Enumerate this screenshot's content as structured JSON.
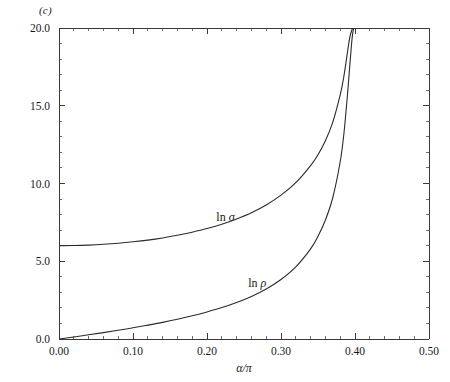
{
  "figure": {
    "panel_label": "(c)",
    "background_color": "#ffffff",
    "line_color": "#2b2b2b",
    "axis_color": "#3a3a3a"
  },
  "axes": {
    "x": {
      "label": "α/π",
      "min": 0.0,
      "max": 0.5,
      "major_ticks": [
        0.0,
        0.1,
        0.2,
        0.3,
        0.4,
        0.5
      ],
      "major_tick_labels": [
        "0.00",
        "0.10",
        "0.20",
        "0.30",
        "0.40",
        "0.50"
      ],
      "minor_tick_step": 0.02
    },
    "y": {
      "label": "",
      "min": 0.0,
      "max": 20.0,
      "major_ticks": [
        0.0,
        5.0,
        10.0,
        15.0,
        20.0
      ],
      "major_tick_labels": [
        "0.0",
        "5.0",
        "10.0",
        "15.0",
        "20.0"
      ],
      "minor_tick_step": 1.0
    }
  },
  "curve_labels": {
    "sigma": {
      "prefix": "ln ",
      "symbol": "σ",
      "x": 0.225,
      "y": 7.6
    },
    "rho": {
      "prefix": "ln ",
      "symbol": "ρ",
      "x": 0.268,
      "y": 3.35
    }
  },
  "chart_data": {
    "type": "line",
    "title": "",
    "subtitle": "",
    "xlabel": "α/π",
    "ylabel": "",
    "xlim": [
      0.0,
      0.5
    ],
    "ylim": [
      0.0,
      20.0
    ],
    "grid": false,
    "legend": "inline-curve-labels",
    "annotations": [
      "(c)"
    ],
    "x": [
      0.0,
      0.02,
      0.04,
      0.06,
      0.08,
      0.1,
      0.12,
      0.14,
      0.16,
      0.18,
      0.2,
      0.22,
      0.24,
      0.26,
      0.28,
      0.3,
      0.32,
      0.34,
      0.35,
      0.36,
      0.37,
      0.38,
      0.385,
      0.39,
      0.393,
      0.396,
      0.398,
      0.3995
    ],
    "series": [
      {
        "name": "ln σ",
        "values": [
          6.0,
          6.01,
          6.04,
          6.09,
          6.16,
          6.25,
          6.36,
          6.5,
          6.67,
          6.87,
          7.1,
          7.38,
          7.72,
          8.12,
          8.62,
          9.25,
          10.05,
          11.15,
          11.85,
          12.75,
          13.95,
          15.7,
          16.9,
          18.5,
          19.4,
          19.9,
          20.0,
          20.0
        ]
      },
      {
        "name": "ln ρ",
        "values": [
          0.0,
          0.13,
          0.27,
          0.41,
          0.56,
          0.72,
          0.89,
          1.07,
          1.27,
          1.49,
          1.74,
          2.02,
          2.35,
          2.74,
          3.22,
          3.83,
          4.64,
          5.8,
          6.6,
          7.65,
          9.1,
          11.4,
          13.2,
          15.8,
          17.6,
          19.3,
          19.95,
          20.0
        ]
      }
    ]
  }
}
